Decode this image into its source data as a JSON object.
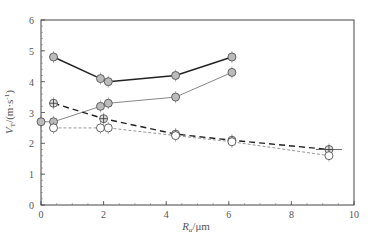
{
  "chart_data": {
    "type": "line",
    "title": "",
    "xlabel": "R_a/μm",
    "ylabel": "V_T/(m·s^-1)",
    "xlim": [
      0,
      10
    ],
    "ylim": [
      0,
      6
    ],
    "xticks": [
      0,
      2,
      4,
      6,
      8,
      10
    ],
    "yticks": [
      0,
      1,
      2,
      3,
      4,
      5,
      6
    ],
    "grid": false,
    "legend": null,
    "series": [
      {
        "name": "series-1",
        "style": "solid",
        "color": "#222222",
        "marker": "circle-filled",
        "x": [
          0.4,
          1.9,
          2.15,
          4.3,
          6.1
        ],
        "y": [
          4.8,
          4.1,
          4.0,
          4.2,
          4.8
        ]
      },
      {
        "name": "series-2",
        "style": "solid",
        "color": "#888888",
        "marker": "circle-filled",
        "x": [
          0,
          0.4,
          1.9,
          2.15,
          4.3,
          6.1
        ],
        "y": [
          2.7,
          2.7,
          3.2,
          3.3,
          3.5,
          4.3
        ]
      },
      {
        "name": "series-3",
        "style": "dashed",
        "color": "#222222",
        "marker": "circle-cross",
        "x": [
          0.4,
          2.0,
          4.3,
          6.1,
          9.2
        ],
        "y": [
          3.3,
          2.8,
          2.3,
          2.1,
          1.8
        ]
      },
      {
        "name": "series-4",
        "style": "dotted",
        "color": "#999999",
        "marker": "circle-open",
        "x": [
          0.4,
          1.9,
          2.15,
          4.3,
          6.1,
          9.2
        ],
        "y": [
          2.5,
          2.5,
          2.5,
          2.25,
          2.05,
          1.6
        ]
      }
    ]
  },
  "axes": {
    "x_label_main": "R",
    "x_label_sub": "a",
    "x_label_unit": "/μm",
    "y_label_main": "V",
    "y_label_sub": "T",
    "y_label_unit": "/(m·s",
    "y_label_sup": "-1",
    "y_label_close": ")"
  }
}
